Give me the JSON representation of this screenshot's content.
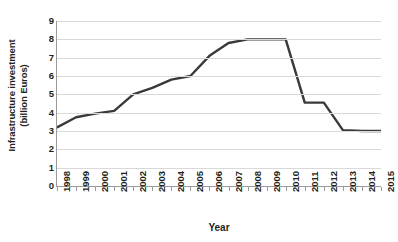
{
  "chart_data": {
    "type": "line",
    "title": "",
    "xlabel": "Year",
    "ylabel": "Infrastructure investment (billion Euros)",
    "ylabel_lines": [
      "Infrastructure investment",
      "(billion Euros)"
    ],
    "categories": [
      "1998",
      "1999",
      "2000",
      "2001",
      "2002",
      "2003",
      "2004",
      "2005",
      "2006",
      "2007",
      "2008",
      "2009",
      "2010",
      "2011",
      "2012",
      "2013",
      "2014",
      "2015"
    ],
    "values": [
      3.2,
      3.75,
      3.95,
      4.1,
      5.0,
      5.35,
      5.8,
      6.0,
      7.1,
      7.8,
      8.0,
      8.0,
      8.0,
      4.55,
      4.55,
      3.05,
      3.0,
      3.0
    ],
    "ylim": [
      0,
      9
    ],
    "yticks": [
      0,
      1,
      2,
      3,
      4,
      5,
      6,
      7,
      8,
      9
    ],
    "ytick_labels": [
      "0",
      "1",
      "2",
      "3",
      "4",
      "5",
      "6",
      "7",
      "8",
      "9"
    ],
    "grid": true,
    "grid_axis": "y",
    "legend": false,
    "series_color": "#3a3a3a",
    "grid_color": "#d9d9d9",
    "axis_color": "#9b9b9b",
    "text_color": "#231f20",
    "line_width": 2.4
  }
}
